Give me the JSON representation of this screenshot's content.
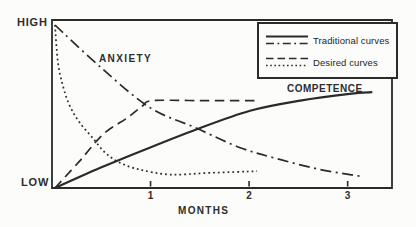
{
  "figure": {
    "y_axis": {
      "high": "HIGH",
      "low": "LOW"
    },
    "x_axis": {
      "label": "MONTHS"
    },
    "curve_labels": {
      "anxiety": "ANXIETY",
      "competence": "COMPETENCE"
    },
    "legend": {
      "items": [
        {
          "label": "Traditional curves",
          "styles": [
            "solid",
            "dash-dot"
          ]
        },
        {
          "label": "Desired curves",
          "styles": [
            "dashed",
            "dotted"
          ]
        }
      ]
    },
    "colors": {
      "ink": "#2a2a2a",
      "paper": "#fcfcfa",
      "text": "#2d2d2d"
    }
  },
  "chart_data": {
    "type": "line",
    "title": "",
    "xlabel": "MONTHS",
    "ylabel": "LOW to HIGH",
    "xlim": [
      0,
      3.45
    ],
    "ylim": [
      0,
      1
    ],
    "x_ticks": [
      1,
      2,
      3
    ],
    "x_tick_labels": [
      "1",
      "2",
      "3"
    ],
    "y_tick_labels": [
      "LOW",
      "HIGH"
    ],
    "grid": false,
    "legend_position": "top-right",
    "series": [
      {
        "id": "anxiety-traditional",
        "name": "Anxiety (traditional)",
        "group": "traditional",
        "style": "dash-dot",
        "x": [
          0.03,
          0.49,
          0.99,
          1.45,
          1.91,
          2.31,
          2.72,
          3.13
        ],
        "y": [
          0.97,
          0.72,
          0.48,
          0.36,
          0.24,
          0.17,
          0.11,
          0.07
        ]
      },
      {
        "id": "competence-traditional",
        "name": "Competence (traditional)",
        "group": "traditional",
        "style": "solid",
        "x": [
          0.03,
          0.49,
          0.99,
          1.47,
          2.01,
          2.52,
          3.02,
          3.25
        ],
        "y": [
          0.0,
          0.12,
          0.24,
          0.35,
          0.46,
          0.52,
          0.56,
          0.57
        ]
      },
      {
        "id": "anxiety-desired",
        "name": "Anxiety (desired)",
        "group": "desired",
        "style": "dotted",
        "x": [
          0.03,
          0.06,
          0.11,
          0.18,
          0.28,
          0.41,
          0.54,
          0.69,
          0.89,
          1.2,
          1.6,
          2.08
        ],
        "y": [
          0.97,
          0.75,
          0.61,
          0.49,
          0.39,
          0.3,
          0.21,
          0.15,
          0.11,
          0.08,
          0.09,
          0.1
        ]
      },
      {
        "id": "competence-desired",
        "name": "Competence (desired)",
        "group": "desired",
        "style": "dashed",
        "x": [
          0.03,
          0.28,
          0.52,
          0.77,
          0.92,
          1.02,
          1.5,
          2.09
        ],
        "y": [
          0.0,
          0.16,
          0.32,
          0.42,
          0.49,
          0.52,
          0.52,
          0.52
        ]
      }
    ],
    "annotations": [
      {
        "text": "ANXIETY",
        "x": 0.72,
        "y": 0.77
      },
      {
        "text": "COMPETENCE",
        "x": 2.73,
        "y": 0.58
      }
    ]
  }
}
